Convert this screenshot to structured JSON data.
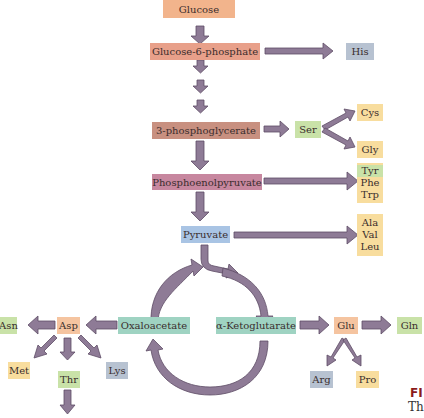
{
  "colors": {
    "arrow": "#8e7b96",
    "arrow_stroke": "#5e4d66",
    "orange": "#f2b48c",
    "salmon": "#e8a08a",
    "brown": "#c89080",
    "mauve": "#c7879f",
    "blue": "#a9c4e4",
    "teal": "#9fd3c2",
    "yellow": "#f8dd9e",
    "green": "#c9e2a8",
    "gray": "#b7c2d1",
    "peach": "#f5c4a0"
  },
  "nodes": {
    "glucose": "Glucose",
    "g6p": "Glucose-6-phosphate",
    "his": "His",
    "pg3": "3-phosphoglycerate",
    "ser": "Ser",
    "cys": "Cys",
    "gly": "Gly",
    "pep": "Phosphoenolpyruvate",
    "tyr": "Tyr",
    "phe": "Phe",
    "trp": "Trp",
    "pyruvate": "Pyruvate",
    "ala": "Ala",
    "val": "Val",
    "leu": "Leu",
    "oxaloacetate": "Oxaloacetate",
    "akg": "α-Ketoglutarate",
    "asp": "Asp",
    "asn": "Asn",
    "met": "Met",
    "thr": "Thr",
    "lys": "Lys",
    "glu": "Glu",
    "gln": "Gln",
    "arg": "Arg",
    "pro": "Pro"
  },
  "caption": {
    "fig_label": "FI",
    "text_start": "Th"
  }
}
